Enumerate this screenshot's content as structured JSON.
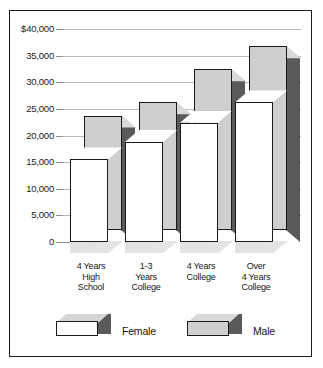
{
  "chart_data": {
    "type": "bar",
    "title": "",
    "subtitle": "",
    "xlabel": "",
    "ylabel": "",
    "categories": [
      "4 Years\nHigh\nSchool",
      "1-3\nYears\nCollege",
      "4 Years\nCollege",
      "Over\n4 Years\nCollege"
    ],
    "series": [
      {
        "name": "Female",
        "values": [
          15500,
          18800,
          22400,
          26200
        ]
      },
      {
        "name": "Male",
        "values": [
          21500,
          24000,
          30200,
          34500
        ]
      }
    ],
    "ylim": [
      0,
      40000
    ],
    "yticks": [
      0,
      5000,
      10000,
      15000,
      20000,
      25000,
      30000,
      35000,
      40000
    ],
    "ytick_labels": [
      "0",
      "5,000",
      "10,000",
      "15,000",
      "20,000",
      "25,000",
      "30,000",
      "35,000",
      "$40,000"
    ],
    "grid": true,
    "legend_position": "bottom",
    "style": "3d-grouped-bar"
  },
  "legend": {
    "entries": [
      {
        "label": "Female",
        "swatch": "white-3d-box"
      },
      {
        "label": "Male",
        "swatch": "gray-3d-box"
      }
    ]
  },
  "colors": {
    "female_front": "#ffffff",
    "male_front": "#cfcfcf",
    "side_dark": "#5a5a5a",
    "top_light": "#d6d6d6",
    "gridline": "#b9b9b9",
    "border": "#1c1c1c"
  }
}
